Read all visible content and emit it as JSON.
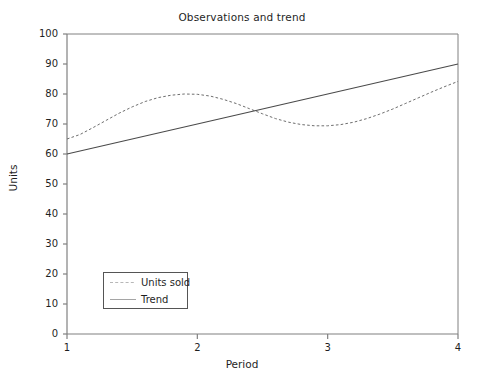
{
  "chart_data": {
    "type": "line",
    "title": "Observations and trend",
    "xlabel": "Period",
    "ylabel": "Units",
    "xlim": [
      1,
      4
    ],
    "ylim": [
      0,
      100
    ],
    "xticks": [
      1,
      2,
      3,
      4
    ],
    "xtick_labels": [
      "1",
      "2",
      "3",
      "4"
    ],
    "yticks": [
      0,
      10,
      20,
      30,
      40,
      50,
      60,
      70,
      80,
      90,
      100
    ],
    "ytick_labels": [
      "0",
      "10",
      "20",
      "30",
      "40",
      "50",
      "60",
      "70",
      "80",
      "90",
      "100"
    ],
    "grid": false,
    "legend_position": "lower left",
    "series": [
      {
        "name": "Units sold",
        "style": "dashed",
        "color": "#6e6e6e",
        "x": [
          1.0,
          1.1,
          1.2,
          1.3,
          1.4,
          1.5,
          1.6,
          1.7,
          1.8,
          1.9,
          2.0,
          2.1,
          2.2,
          2.3,
          2.4,
          2.5,
          2.6,
          2.7,
          2.8,
          2.9,
          3.0,
          3.1,
          3.2,
          3.3,
          3.4,
          3.5,
          3.6,
          3.7,
          3.8,
          3.9,
          4.0
        ],
        "values": [
          65.0,
          66.5,
          68.8,
          71.2,
          73.6,
          75.7,
          77.5,
          78.8,
          79.6,
          80.0,
          79.9,
          79.3,
          78.2,
          76.8,
          75.1,
          73.4,
          71.8,
          70.6,
          69.8,
          69.4,
          69.4,
          69.8,
          70.6,
          71.8,
          73.3,
          75.0,
          76.9,
          78.8,
          80.7,
          82.5,
          84.2
        ]
      },
      {
        "name": "Trend",
        "style": "solid",
        "color": "#4a4a4a",
        "x": [
          1,
          4
        ],
        "values": [
          60,
          90
        ]
      }
    ]
  },
  "legend": {
    "entries": [
      {
        "label": "Units sold"
      },
      {
        "label": "Trend"
      }
    ]
  },
  "axes": {
    "frame_color": "#808080"
  }
}
